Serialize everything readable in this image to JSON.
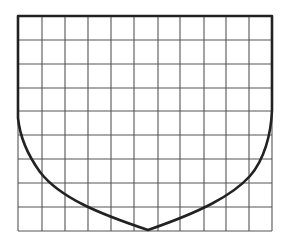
{
  "diagram": {
    "type": "grid-with-shield-outline",
    "grid": {
      "columns": 11,
      "rows": 9,
      "x_lines": [
        18,
        42,
        65,
        88,
        111,
        134,
        158,
        180,
        204,
        226,
        249,
        272
      ],
      "y_lines": [
        16,
        40,
        64,
        88,
        111,
        135,
        159,
        183,
        207,
        231
      ],
      "line_color": "#555555"
    },
    "outline": {
      "color": "#222222",
      "description": "Flat top edge, straight vertical sides descending into curved lower edges meeting at a bottom point",
      "path": "M18,118 L18,16 L272,16 L272,110 C271,135 264,160 250,176 C232,196 200,212 148,230 C100,214 60,198 40,172 C27,154 20,138 18,118 Z"
    },
    "background": "#ffffff"
  }
}
